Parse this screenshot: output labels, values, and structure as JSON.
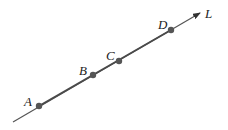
{
  "diagram": {
    "line": {
      "label": "L",
      "start": [
        13,
        122
      ],
      "end": [
        200,
        13
      ],
      "color": "#555555"
    },
    "points": [
      {
        "label": "A",
        "x": 39,
        "y": 106,
        "label_x": 24,
        "label_y": 106
      },
      {
        "label": "B",
        "x": 93,
        "y": 75,
        "label_x": 79,
        "label_y": 75
      },
      {
        "label": "C",
        "x": 119,
        "y": 61,
        "label_x": 106,
        "label_y": 60
      },
      {
        "label": "D",
        "x": 171,
        "y": 30,
        "label_x": 158,
        "label_y": 29
      }
    ],
    "point_color": "#555555"
  }
}
